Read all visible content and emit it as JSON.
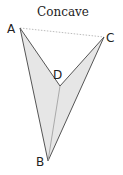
{
  "diagram": {
    "title": "Concave",
    "vertices": [
      {
        "label": "A",
        "x": 20,
        "y": 28,
        "lx": 7,
        "ly": 33
      },
      {
        "label": "C",
        "x": 104,
        "y": 37,
        "lx": 106,
        "ly": 42
      },
      {
        "label": "D",
        "x": 60,
        "y": 86,
        "lx": 53,
        "ly": 79
      },
      {
        "label": "B",
        "x": 48,
        "y": 161,
        "lx": 36,
        "ly": 166
      }
    ],
    "fill_color": "#e6e6e6",
    "edge_color": "#555555",
    "dashed_color": "#aaaaaa"
  }
}
